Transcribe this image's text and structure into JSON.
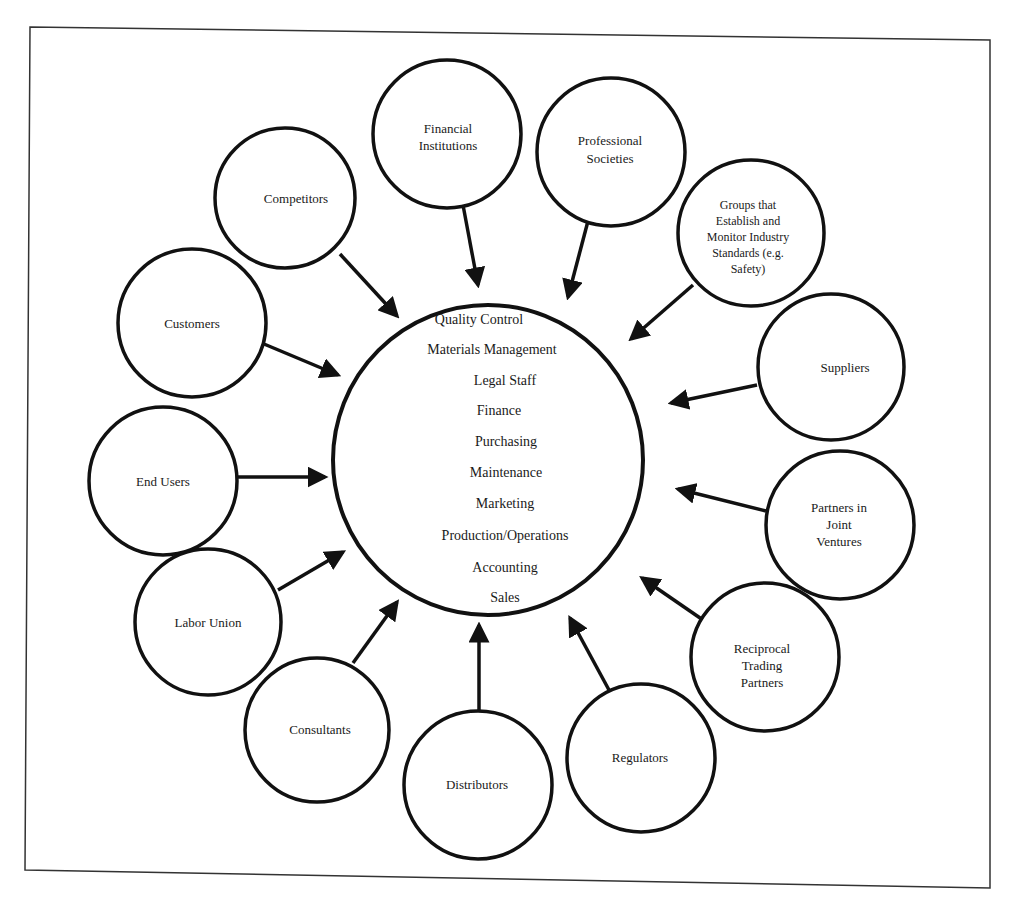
{
  "diagram": {
    "type": "hub-and-spoke",
    "hub": {
      "functions": [
        "Quality Control",
        "Materials Management",
        "Legal Staff",
        "Finance",
        "Purchasing",
        "Maintenance",
        "Marketing",
        "Production/Operations",
        "Accounting",
        "Sales"
      ]
    },
    "nodes": [
      {
        "id": "competitors",
        "lines": [
          "Competitors"
        ]
      },
      {
        "id": "financial-institutions",
        "lines": [
          "Financial",
          "Institutions"
        ]
      },
      {
        "id": "professional-societies",
        "lines": [
          "Professional",
          "Societies"
        ]
      },
      {
        "id": "standards-groups",
        "lines": [
          "Groups that",
          "Establish and",
          "Monitor Industry",
          "Standards (e.g.",
          "Safety)"
        ]
      },
      {
        "id": "customers",
        "lines": [
          "Customers"
        ]
      },
      {
        "id": "suppliers",
        "lines": [
          "Suppliers"
        ]
      },
      {
        "id": "end-users",
        "lines": [
          "End Users"
        ]
      },
      {
        "id": "joint-venture-partners",
        "lines": [
          "Partners in",
          "Joint",
          "Ventures"
        ]
      },
      {
        "id": "labor-union",
        "lines": [
          "Labor Union"
        ]
      },
      {
        "id": "reciprocal-trading-partners",
        "lines": [
          "Reciprocal",
          "Trading",
          "Partners"
        ]
      },
      {
        "id": "consultants",
        "lines": [
          "Consultants"
        ]
      },
      {
        "id": "distributors",
        "lines": [
          "Distributors"
        ]
      },
      {
        "id": "regulators",
        "lines": [
          "Regulators"
        ]
      }
    ],
    "edges_direction": "all outer nodes point to central hub"
  }
}
